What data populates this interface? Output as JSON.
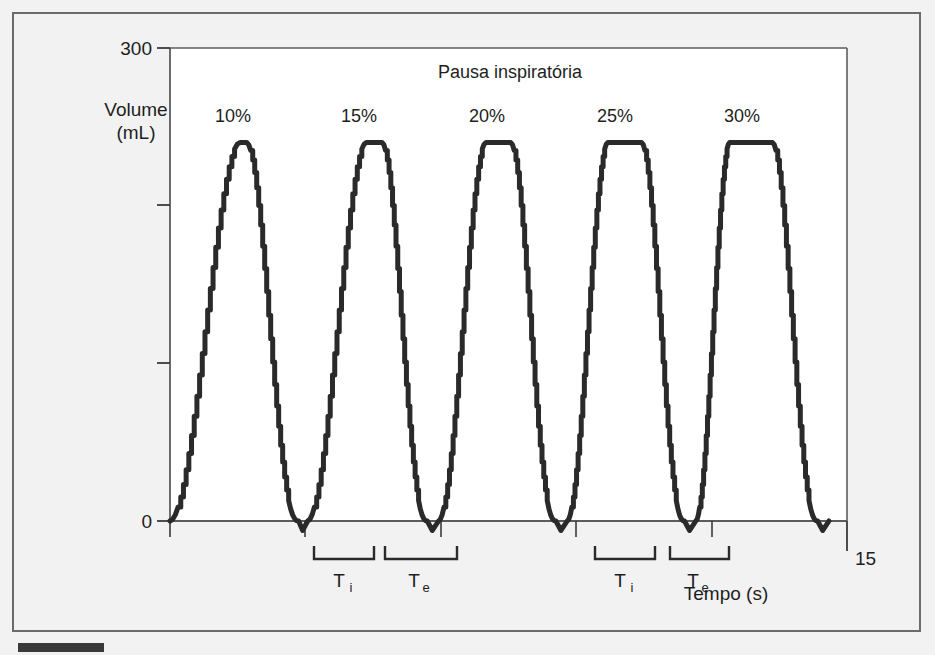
{
  "figure": {
    "background_color": "#f2f2f2",
    "plot_background_color": "#ffffff",
    "frame_color": "#6b6b6b",
    "caption_marker": "caption-bar"
  },
  "chart_data": {
    "type": "line",
    "title": "Pausa inspiratória",
    "xlabel": "Tempo (s)",
    "ylabel": "Volume\n(mL)",
    "ylabel_line1": "Volume",
    "ylabel_line2": "(mL)",
    "xlim": [
      0,
      15
    ],
    "ylim": [
      0,
      300
    ],
    "grid": false,
    "legend": "none",
    "line_color": "#2a2a2a",
    "line_width": 5,
    "y_ticks": [
      0,
      100,
      200,
      300
    ],
    "y_tick_labels": [
      "0",
      "",
      "",
      "300"
    ],
    "x_ticks": [
      0,
      3,
      6,
      9,
      12,
      15
    ],
    "x_tick_labels": [
      "",
      "",
      "",
      "",
      "",
      "15"
    ],
    "x_axis_max_label": "15",
    "y_axis_max_label": "300",
    "y_axis_min_label": "0",
    "annotations": [
      {
        "label": "10%",
        "x": 1.5,
        "y": 275
      },
      {
        "label": "15%",
        "x": 4.3,
        "y": 275
      },
      {
        "label": "20%",
        "x": 7.1,
        "y": 275
      },
      {
        "label": "25%",
        "x": 9.9,
        "y": 275
      },
      {
        "label": "30%",
        "x": 12.7,
        "y": 275
      }
    ],
    "phase_brackets": [
      {
        "base": "T",
        "sub": "i",
        "x_start": 3.1,
        "x_end": 4.0,
        "group": 1
      },
      {
        "base": "T",
        "sub": "e",
        "x_start": 4.2,
        "x_end": 5.3,
        "group": 1
      },
      {
        "base": "T",
        "sub": "i",
        "x_start": 7.35,
        "x_end": 8.25,
        "group": 2
      },
      {
        "base": "T",
        "sub": "e",
        "x_start": 8.45,
        "x_end": 9.35,
        "group": 2
      }
    ],
    "series": [
      {
        "name": "Volume-time waveform",
        "peak_value": 240,
        "baseline_value": 0,
        "breath_count": 5,
        "pause_percentages": [
          "10%",
          "15%",
          "20%",
          "25%",
          "30%"
        ],
        "breaths": [
          {
            "pause_label": "10%",
            "start": 0.0,
            "rise_end": 1.55,
            "plateau_end": 1.7,
            "fall_end": 2.85,
            "trough_end": 3.05,
            "peak": 240
          },
          {
            "pause_label": "15%",
            "start": 3.05,
            "rise_end": 4.35,
            "plateau_end": 4.7,
            "fall_end": 5.7,
            "trough_end": 5.95,
            "peak": 240
          },
          {
            "pause_label": "20%",
            "start": 5.95,
            "rise_end": 7.0,
            "plateau_end": 7.55,
            "fall_end": 8.55,
            "trough_end": 8.8,
            "peak": 240
          },
          {
            "pause_label": "25%",
            "start": 8.8,
            "rise_end": 9.7,
            "plateau_end": 10.45,
            "fall_end": 11.4,
            "trough_end": 11.65,
            "peak": 240
          },
          {
            "pause_label": "30%",
            "start": 11.65,
            "rise_end": 12.4,
            "plateau_end": 13.35,
            "fall_end": 14.35,
            "trough_end": 14.6,
            "peak": 240
          }
        ]
      }
    ]
  }
}
